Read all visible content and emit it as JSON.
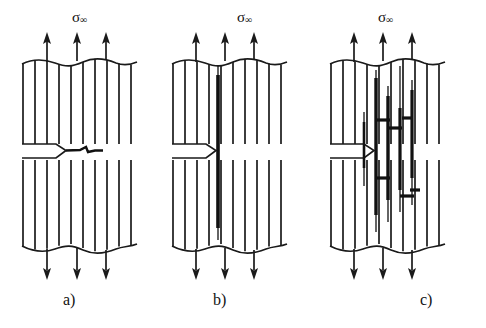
{
  "figure": {
    "caption_absent": true,
    "panels": [
      {
        "id": "a",
        "label": "a)",
        "stress_symbol": "σ",
        "stress_subscript": "∞",
        "stress_label_full": "σ∞",
        "damage_mode": "transverse-crack-from-notch",
        "arrows_top": 3,
        "arrows_bottom": 3,
        "fiber_lines": 10
      },
      {
        "id": "b",
        "label": "b)",
        "stress_symbol": "σ",
        "stress_subscript": "∞",
        "stress_label_full": "σ∞",
        "damage_mode": "axial-splitting-crack-from-notch",
        "arrows_top": 3,
        "arrows_bottom": 3,
        "fiber_lines": 10
      },
      {
        "id": "c",
        "label": "c)",
        "stress_symbol": "σ",
        "stress_subscript": "∞",
        "stress_label_full": "σ∞",
        "damage_mode": "multiple-splits-and-transverse-bridging-cracks",
        "arrows_top": 3,
        "arrows_bottom": 3,
        "fiber_lines": 10
      }
    ],
    "colors": {
      "ink": "#1a1a1a",
      "background": "#ffffff",
      "crack": "#111111"
    }
  }
}
